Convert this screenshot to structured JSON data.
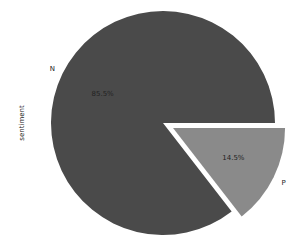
{
  "chart_data": {
    "type": "pie",
    "title": "",
    "ylabel": "sentiment",
    "categories": [
      "N",
      "P"
    ],
    "values": [
      85.5,
      14.5
    ],
    "labels": [
      "85.5%",
      "14.5%"
    ],
    "colors": [
      "#4a4a4a",
      "#8a8a8a"
    ],
    "explode": [
      0,
      0.1
    ],
    "legend": false
  }
}
